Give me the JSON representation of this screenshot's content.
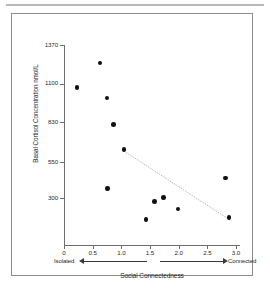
{
  "figure": {
    "kind": "scatter-plot-figure",
    "background_color": "#ffffff",
    "frame_color": "#8c8c8c",
    "rule_color": "#b9b9b9"
  },
  "chart_data": {
    "type": "scatter",
    "title": "",
    "xlabel": "Social Connectedness",
    "ylabel": "Basal Cortisol Concentration  nmol/L",
    "xlim": [
      0,
      3.0
    ],
    "ylim": [
      0,
      1370
    ],
    "grid": false,
    "legend": "none",
    "point_color": "#111111",
    "trend_color": "#9a9a9a",
    "xticks": [
      0,
      0.5,
      1.0,
      1.5,
      2.0,
      2.5,
      3.0
    ],
    "xtick_labels": [
      "0",
      "0.5",
      "1.0",
      "1.5",
      "2.0",
      "2.5",
      "3.0"
    ],
    "yticks": [
      300,
      550,
      830,
      1100,
      1370
    ],
    "ytick_labels": [
      "300",
      "550",
      "830",
      "1100",
      "1370"
    ],
    "x_anchor_low": "Isolated",
    "x_anchor_high": "Connected",
    "points": [
      {
        "x": 0.23,
        "y": 1075
      },
      {
        "x": 0.63,
        "y": 1245
      },
      {
        "x": 0.75,
        "y": 1000
      },
      {
        "x": 0.86,
        "y": 815
      },
      {
        "x": 1.05,
        "y": 640
      },
      {
        "x": 0.76,
        "y": 365
      },
      {
        "x": 1.43,
        "y": 150
      },
      {
        "x": 1.58,
        "y": 275
      },
      {
        "x": 1.74,
        "y": 305
      },
      {
        "x": 1.99,
        "y": 225
      },
      {
        "x": 2.82,
        "y": 440
      },
      {
        "x": 2.88,
        "y": 165
      }
    ],
    "trend_line": {
      "x_start": 1.08,
      "y_start": 620,
      "x_end": 2.92,
      "y_end": 140,
      "style": "dotted"
    }
  }
}
